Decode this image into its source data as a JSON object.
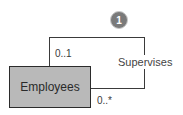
{
  "diagram": {
    "type": "ER self-referencing relationship",
    "entity": {
      "name": "Employees",
      "fill": "#b9b9b9"
    },
    "relationship": {
      "label": "Supervises",
      "cardinality_top": "0..1",
      "cardinality_bottom": "0..*"
    },
    "callout": {
      "number": "1",
      "fill": "#7a7a7a"
    }
  }
}
